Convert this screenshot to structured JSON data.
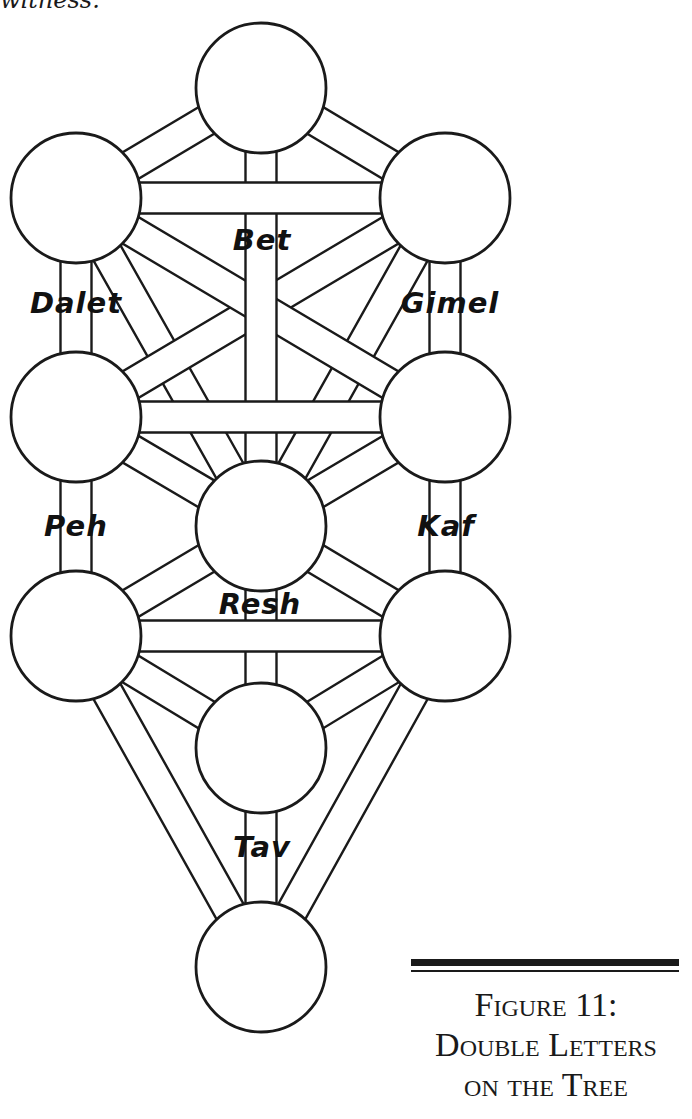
{
  "page": {
    "text_fragment": "witness."
  },
  "figure": {
    "caption_lines": [
      "Figure 11:",
      "Double Letters",
      "on the Tree"
    ],
    "stroke_color": "#1a1a1a",
    "fill_color": "#ffffff",
    "band_half_width": 15.5,
    "sephirot_radius": 65,
    "sephirot": [
      {
        "id": "s1",
        "cx": 261,
        "cy": 88
      },
      {
        "id": "s2",
        "cx": 445,
        "cy": 198
      },
      {
        "id": "s3",
        "cx": 76,
        "cy": 198
      },
      {
        "id": "s4",
        "cx": 445,
        "cy": 417
      },
      {
        "id": "s5",
        "cx": 76,
        "cy": 417
      },
      {
        "id": "s6",
        "cx": 261,
        "cy": 526
      },
      {
        "id": "s7",
        "cx": 445,
        "cy": 636
      },
      {
        "id": "s8",
        "cx": 76,
        "cy": 636
      },
      {
        "id": "s9",
        "cx": 261,
        "cy": 748
      },
      {
        "id": "s10",
        "cx": 261,
        "cy": 967
      }
    ],
    "paths": [
      [
        "s2",
        "s6"
      ],
      [
        "s3",
        "s6"
      ],
      [
        "s2",
        "s5"
      ],
      [
        "s3",
        "s4"
      ],
      [
        "s4",
        "s6"
      ],
      [
        "s5",
        "s6"
      ],
      [
        "s6",
        "s7"
      ],
      [
        "s6",
        "s8"
      ],
      [
        "s7",
        "s9"
      ],
      [
        "s8",
        "s9"
      ],
      [
        "s7",
        "s10"
      ],
      [
        "s8",
        "s10"
      ],
      [
        "s1",
        "s2"
      ],
      [
        "s1",
        "s3"
      ],
      [
        "s2",
        "s4"
      ],
      [
        "s3",
        "s5"
      ],
      [
        "s4",
        "s7"
      ],
      [
        "s5",
        "s8"
      ],
      [
        "s1",
        "s6"
      ],
      [
        "s6",
        "s9"
      ],
      [
        "s9",
        "s10"
      ],
      [
        "s2",
        "s3"
      ],
      [
        "s4",
        "s5"
      ],
      [
        "s7",
        "s8"
      ]
    ],
    "letters": [
      {
        "name": "Bet",
        "x": 262,
        "y": 240
      },
      {
        "name": "Dalet",
        "x": 76,
        "y": 303
      },
      {
        "name": "Gimel",
        "x": 450,
        "y": 303
      },
      {
        "name": "Peh",
        "x": 76,
        "y": 526
      },
      {
        "name": "Kaf",
        "x": 446,
        "y": 526
      },
      {
        "name": "Resh",
        "x": 260,
        "y": 604
      },
      {
        "name": "Tav",
        "x": 262,
        "y": 847
      }
    ]
  }
}
